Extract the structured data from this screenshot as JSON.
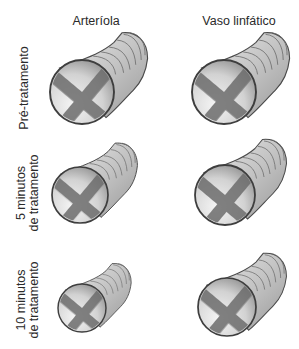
{
  "columns": [
    {
      "label": "Arteríola"
    },
    {
      "label": "Vaso linfático"
    }
  ],
  "rows": [
    {
      "label_lines": [
        "Pré-tratamento"
      ]
    },
    {
      "label_lines": [
        "5 minutos",
        "de tratamento"
      ]
    },
    {
      "label_lines": [
        "10 minutos",
        "de tratamento"
      ]
    }
  ],
  "vessels": [
    {
      "row": 0,
      "column": "Arteríola",
      "cx": 82,
      "cy": 92,
      "r": 32
    },
    {
      "row": 0,
      "column": "Vaso linfático",
      "cx": 224,
      "cy": 92,
      "r": 32
    },
    {
      "row": 1,
      "column": "Arteríola",
      "cx": 80,
      "cy": 195,
      "r": 28
    },
    {
      "row": 1,
      "column": "Vaso linfático",
      "cx": 225,
      "cy": 195,
      "r": 30
    },
    {
      "row": 2,
      "column": "Arteríola",
      "cx": 82,
      "cy": 308,
      "r": 24
    },
    {
      "row": 2,
      "column": "Vaso linfático",
      "cx": 227,
      "cy": 307,
      "r": 29
    }
  ],
  "colors": {
    "outline": "#4a4a4a",
    "tube_fill": "#cfcfcf",
    "lumen_fill": "#e4e4e4",
    "text": "#2a2a2a"
  }
}
